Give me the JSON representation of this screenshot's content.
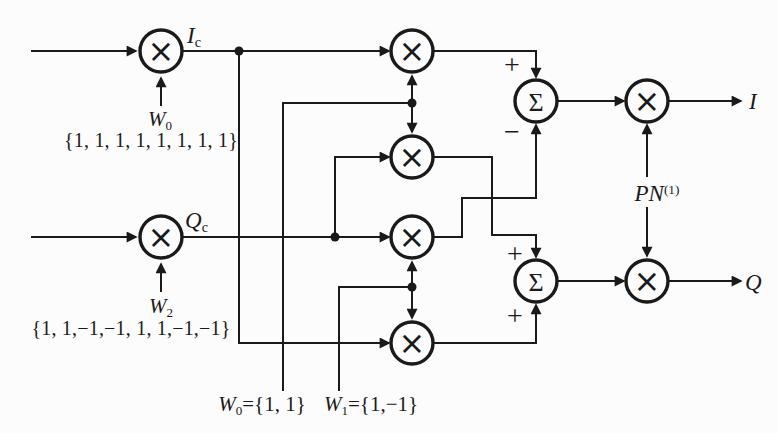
{
  "colors": {
    "background": "#fcfcfc",
    "ink": "#1a1a1a"
  },
  "operators": {
    "multiply": "×",
    "sum": "Σ"
  },
  "signs": {
    "sum_i_top": "+",
    "sum_i_bottom": "−",
    "sum_q_top": "+",
    "sum_q_bottom": "+"
  },
  "labels": {
    "i_chip": {
      "base": "I",
      "sub": "c"
    },
    "q_chip": {
      "base": "Q",
      "sub": "c"
    },
    "walsh0_input": {
      "base": "W",
      "sub": "0"
    },
    "walsh0_sequence": "{1, 1, 1, 1, 1, 1, 1, 1}",
    "walsh2_input": {
      "base": "W",
      "sub": "2"
    },
    "walsh2_sequence": "{1, 1,−1,−1, 1, 1,−1,−1}",
    "walsh0_def": {
      "base": "W",
      "sub": "0",
      "value": "={1, 1}"
    },
    "walsh1_def": {
      "base": "W",
      "sub": "1",
      "value": "={1,−1}"
    },
    "pn_code": {
      "base": "PN",
      "sup": "(1)"
    },
    "output_i": "I",
    "output_q": "Q"
  }
}
